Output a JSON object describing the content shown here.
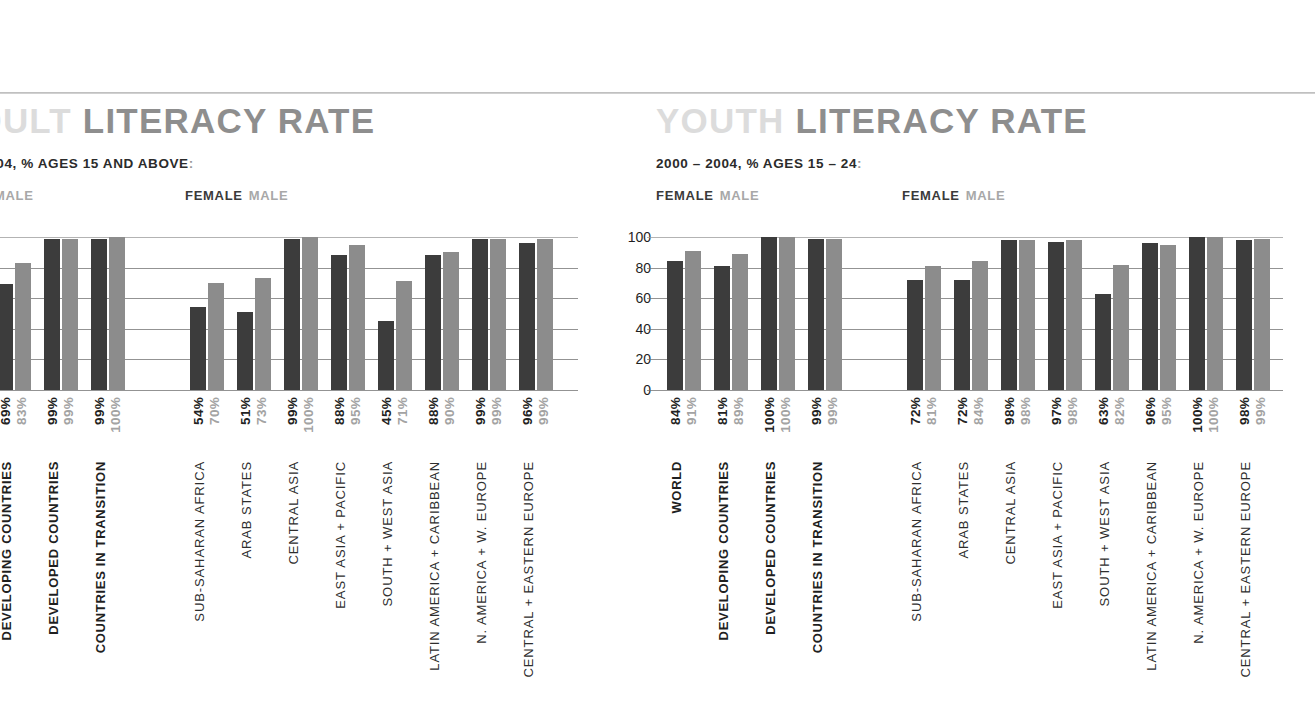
{
  "page": {
    "background": "#ffffff",
    "rule_color": "#c4c4c4"
  },
  "panels": [
    {
      "id": "adult",
      "clipped_left": true,
      "title_soft": "ADULT",
      "title_hard": "LITERACY RATE",
      "title_soft_visible": ".ADULT",
      "subtitle_visible": "000 – 2004, % AGES 15 AND ABOVE",
      "subtitle_full": "2000 – 2004, % AGES 15 AND ABOVE",
      "subtitle_colon": ":",
      "legend": {
        "left": {
          "female": "EMALE",
          "male": "MALE"
        },
        "right": {
          "female": "FEMALE",
          "male": "MALE"
        }
      },
      "y_ticks": [
        "100",
        "80",
        "60",
        "40",
        "20",
        "0"
      ],
      "y_ticks_visible": false
    },
    {
      "id": "youth",
      "clipped_left": false,
      "title_soft": "YOUTH",
      "title_hard": "LITERACY RATE",
      "title_soft_visible": "YOUTH",
      "subtitle_visible": "2000 – 2004, % AGES 15 – 24",
      "subtitle_full": "2000 – 2004, % AGES 15 – 24",
      "subtitle_colon": ":",
      "legend": {
        "left": {
          "female": "FEMALE",
          "male": "MALE"
        },
        "right": {
          "female": "FEMALE",
          "male": "MALE"
        }
      },
      "y_ticks": [
        "100",
        "80",
        "60",
        "40",
        "20",
        "0"
      ],
      "y_ticks_visible": true
    }
  ],
  "colors": {
    "female_bar": "#3c3c3c",
    "male_bar": "#8c8c8c",
    "female_label": "#222222",
    "male_label": "#a3a3a3",
    "title_soft": "#dcdcdc",
    "title_hard": "#8e8e8e",
    "gridline": "#6f6f6f"
  },
  "chart_data": [
    {
      "type": "bar",
      "title": "ADULT LITERACY RATE",
      "subtitle": "2000 – 2004, % AGES 15 AND ABOVE",
      "xlabel": "",
      "ylabel": "",
      "ylim": [
        0,
        100
      ],
      "yticks": [
        0,
        20,
        40,
        60,
        80,
        100
      ],
      "grid": true,
      "legend": [
        "FEMALE",
        "MALE"
      ],
      "legend_position": "top-left",
      "categories": [
        "WORLD",
        "DEVELOPING COUNTRIES",
        "DEVELOPED COUNTRIES",
        "COUNTRIES IN TRANSITION",
        "SUB-SAHARAN AFRICA",
        "ARAB STATES",
        "CENTRAL ASIA",
        "EAST ASIA + PACIFIC",
        "SOUTH + WEST ASIA",
        "LATIN AMERICA + CARIBBEAN",
        "N. AMERICA + W. EUROPE",
        "CENTRAL + EASTERN EUROPE"
      ],
      "category_kinds": [
        "aggregate",
        "aggregate",
        "aggregate",
        "aggregate",
        "region",
        "region",
        "region",
        "region",
        "region",
        "region",
        "region",
        "region"
      ],
      "series": [
        {
          "name": "FEMALE",
          "values": [
            77,
            69,
            99,
            99,
            54,
            51,
            99,
            88,
            45,
            88,
            99,
            96
          ]
        },
        {
          "name": "MALE",
          "values": [
            87,
            83,
            99,
            100,
            70,
            73,
            100,
            95,
            71,
            90,
            99,
            99
          ]
        }
      ],
      "value_labels": {
        "FEMALE": [
          "77%",
          "69%",
          "99%",
          "99%",
          "54%",
          "51%",
          "99%",
          "88%",
          "45%",
          "88%",
          "99%",
          "96%"
        ],
        "MALE": [
          "87%",
          "83%",
          "99%",
          "100%",
          "70%",
          "73%",
          "100%",
          "95%",
          "71%",
          "90%",
          "99%",
          "99%"
        ]
      }
    },
    {
      "type": "bar",
      "title": "YOUTH LITERACY RATE",
      "subtitle": "2000 – 2004, % AGES 15 – 24",
      "xlabel": "",
      "ylabel": "",
      "ylim": [
        0,
        100
      ],
      "yticks": [
        0,
        20,
        40,
        60,
        80,
        100
      ],
      "grid": true,
      "legend": [
        "FEMALE",
        "MALE"
      ],
      "legend_position": "top-left",
      "categories": [
        "WORLD",
        "DEVELOPING COUNTRIES",
        "DEVELOPED COUNTRIES",
        "COUNTRIES IN TRANSITION",
        "SUB-SAHARAN AFRICA",
        "ARAB STATES",
        "CENTRAL ASIA",
        "EAST ASIA + PACIFIC",
        "SOUTH + WEST ASIA",
        "LATIN AMERICA + CARIBBEAN",
        "N. AMERICA + W. EUROPE",
        "CENTRAL + EASTERN EUROPE"
      ],
      "category_kinds": [
        "aggregate",
        "aggregate",
        "aggregate",
        "aggregate",
        "region",
        "region",
        "region",
        "region",
        "region",
        "region",
        "region",
        "region"
      ],
      "series": [
        {
          "name": "FEMALE",
          "values": [
            84,
            81,
            100,
            99,
            72,
            72,
            98,
            97,
            63,
            96,
            100,
            98
          ]
        },
        {
          "name": "MALE",
          "values": [
            91,
            89,
            100,
            99,
            81,
            84,
            98,
            98,
            82,
            95,
            100,
            99
          ]
        }
      ],
      "value_labels": {
        "FEMALE": [
          "84%",
          "81%",
          "100%",
          "99%",
          "72%",
          "72%",
          "98%",
          "97%",
          "63%",
          "96%",
          "100%",
          "98%"
        ],
        "MALE": [
          "91%",
          "89%",
          "100%",
          "99%",
          "81%",
          "84%",
          "98%",
          "98%",
          "82%",
          "95%",
          "100%",
          "99%"
        ]
      }
    }
  ]
}
